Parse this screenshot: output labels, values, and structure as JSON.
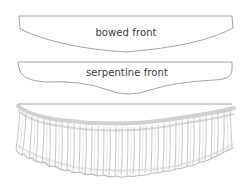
{
  "figure": {
    "shapes": [
      {
        "id": "bowed",
        "label": "bowed front",
        "label_x": 126,
        "label_y": 28
      },
      {
        "id": "serpentine",
        "label": "serpentine front",
        "label_x": 126,
        "label_y": 68
      },
      {
        "id": "gathered",
        "label": ""
      }
    ],
    "colors": {
      "stroke": "#8a8a8a",
      "text": "#3a3a3a",
      "ruffle": "#b5b5b5",
      "background": "#ffffff"
    }
  }
}
